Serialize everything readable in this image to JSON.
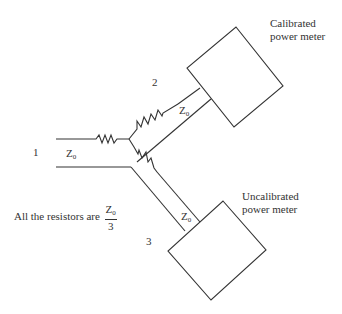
{
  "diagram": {
    "ports": {
      "port1": "1",
      "port2": "2",
      "port3": "3"
    },
    "line_labels": {
      "z_main": "Z",
      "z_port1_sub": "0",
      "z_port2": "Z",
      "z_port2_sub": "0",
      "z_port3": "Z",
      "z_port3_sub": "0"
    },
    "meters": {
      "calibrated_line1": "Calibrated",
      "calibrated_line2": "power meter",
      "uncalibrated_line1": "Uncalibrated",
      "uncalibrated_line2": "power meter"
    },
    "note": {
      "text": "All the resistors are",
      "frac_num": "Z",
      "frac_num_sub": "0",
      "frac_den": "3"
    },
    "stroke_color": "#333333"
  }
}
